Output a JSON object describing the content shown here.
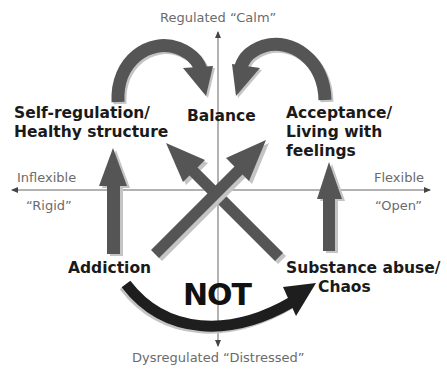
{
  "axes": {
    "top": "Regulated “Calm”",
    "bottom": "Dysregulated “Distressed”",
    "left_top": "Inflexible",
    "left_bottom": "“Rigid”",
    "right_top": "Flexible",
    "right_bottom": "“Open”"
  },
  "nodes": {
    "self_regulation": {
      "line1": "Self-regulation/",
      "line2": "Healthy structure"
    },
    "balance": {
      "line1": "Balance"
    },
    "acceptance": {
      "line1": "Acceptance/",
      "line2": "Living with",
      "line3": "feelings"
    },
    "addiction": {
      "line1": "Addiction"
    },
    "substance_abuse": {
      "line1": "Substance abuse/",
      "line2": "Chaos"
    }
  },
  "not_label": "NOT",
  "colors": {
    "arrow_gray": "#555555",
    "arrow_shadow": "#c4c4c4",
    "arrow_dark": "#1e1e1e",
    "axis": "#444444",
    "axis_text": "#6b6b6b",
    "node_text": "#1a1a1a"
  },
  "arrows": [
    {
      "from": "Self-regulation/Healthy structure",
      "to": "Balance",
      "style": "curved"
    },
    {
      "from": "Acceptance/Living with feelings",
      "to": "Balance",
      "style": "curved"
    },
    {
      "from": "Addiction",
      "to": "Self-regulation/Healthy structure",
      "style": "straight"
    },
    {
      "from": "Substance abuse/Chaos",
      "to": "Acceptance/Living with feelings",
      "style": "straight"
    },
    {
      "from": "Addiction",
      "to": "Acceptance/Living with feelings",
      "style": "diagonal"
    },
    {
      "from": "Substance abuse/Chaos",
      "to": "Self-regulation/Healthy structure",
      "style": "diagonal"
    },
    {
      "from": "Addiction",
      "to": "Substance abuse/Chaos",
      "style": "curved-dark",
      "label": "NOT"
    }
  ]
}
